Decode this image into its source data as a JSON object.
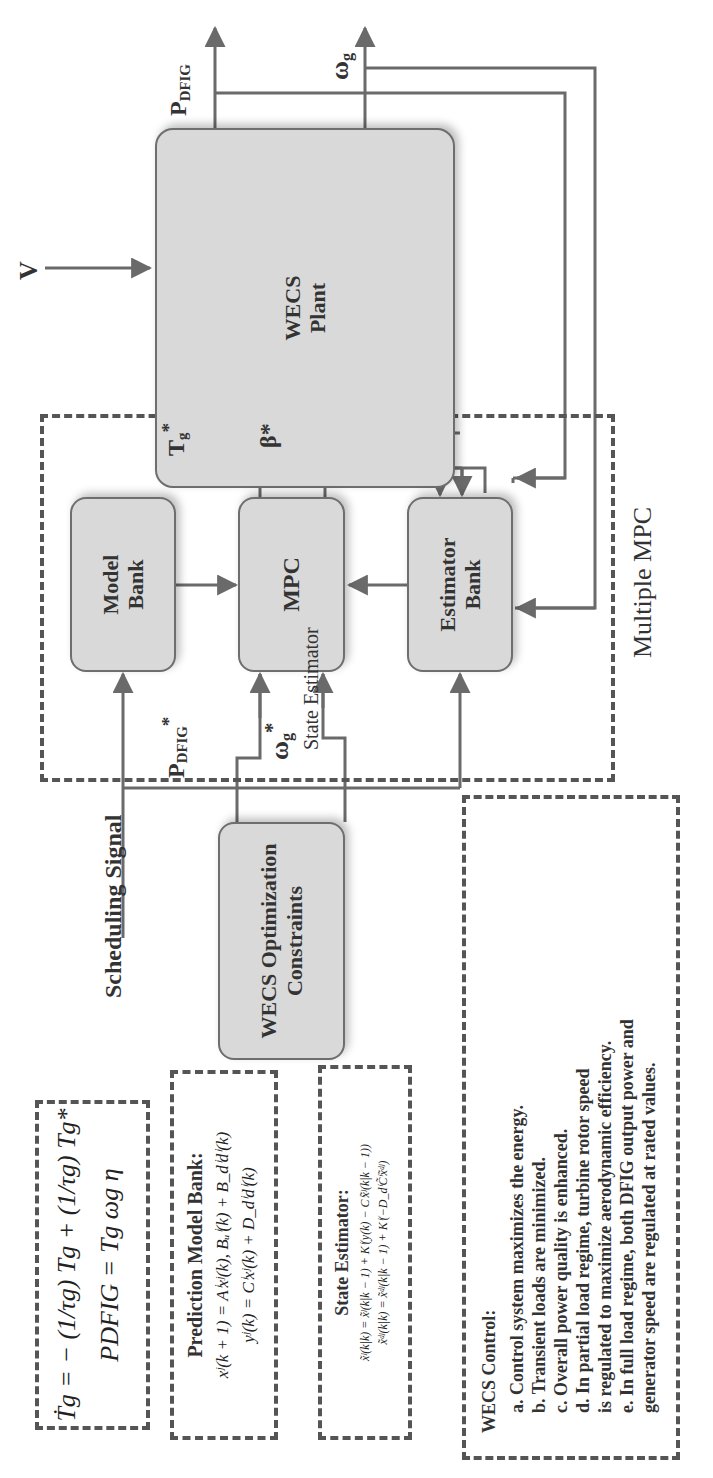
{
  "diagram": {
    "blocks": {
      "plant": [
        "WECS",
        "Plant"
      ],
      "model_bank": [
        "Model",
        "Bank"
      ],
      "mpc": [
        "MPC"
      ],
      "estimator_bank": [
        "Estimator",
        "Bank"
      ],
      "optimization": [
        "WECS Optimization",
        "Constraints"
      ]
    },
    "group_label": "Multiple MPC",
    "signals": {
      "wind": "V",
      "p_dfig_main": "P",
      "p_dfig_sub": "DFIG",
      "omega_g_main": "ω",
      "omega_g_sub": "g",
      "tg_star_main": "T",
      "tg_star_sub": "g",
      "tg_star_sup": "*",
      "beta_star": "β*",
      "p_dfig_ref_main": "P",
      "p_dfig_ref_sub": "DFIG",
      "p_dfig_ref_sup": "*",
      "omega_ref_main": "ω",
      "omega_ref_sub": "g",
      "omega_ref_sup": "*",
      "state_estimator": "State Estimator",
      "scheduling": "Scheduling Signal"
    },
    "equations": {
      "torque_dynamics": "Ṫg = − (1/τg) Tg + (1/τg) Tg*",
      "power": "PDFIG = Tg ωg η"
    },
    "prediction_model_bank": {
      "title": "Prediction Model Bank:",
      "eq1": "xʲ(k + 1) = Aⁱxʲ(k), Bᵤⁱ(k) + B_dⁱdⁱ(k)",
      "eq2": "yʲ(k) = Cⁱxʲ(k) + D_dⁱdⁱ(k)"
    },
    "state_estimator_box": {
      "title": "State Estimator:",
      "eq1": "x̃ʲ(k|k) = x̃ʲ(k|k − 1) + Kⁱ(y(k) − Cⁱx̃ʲ(k|k − 1))",
      "eq2": "x̃ᵈʲ(k|k) = x̃ᵈʲ(k|k − 1) + Kⁱ(−D_dⁱC̃ⁱx̃ᵈʲ)"
    },
    "wecs_control": {
      "title": "WECS Control:",
      "items": [
        "a. Control system maximizes the energy.",
        "b. Transient loads are minimized.",
        "c. Overall power quality is enhanced.",
        "d. In partial load regime, turbine rotor speed",
        "is regulated to maximize aerodynamic efficiency.",
        "e. In full load regime, both DFIG output power and",
        "generator speed are regulated at rated values."
      ]
    },
    "colors": {
      "block_fill": "#d9d9d9",
      "block_border": "#6e6e6e",
      "wire": "#6a6a6a",
      "dash": "#555555"
    }
  }
}
